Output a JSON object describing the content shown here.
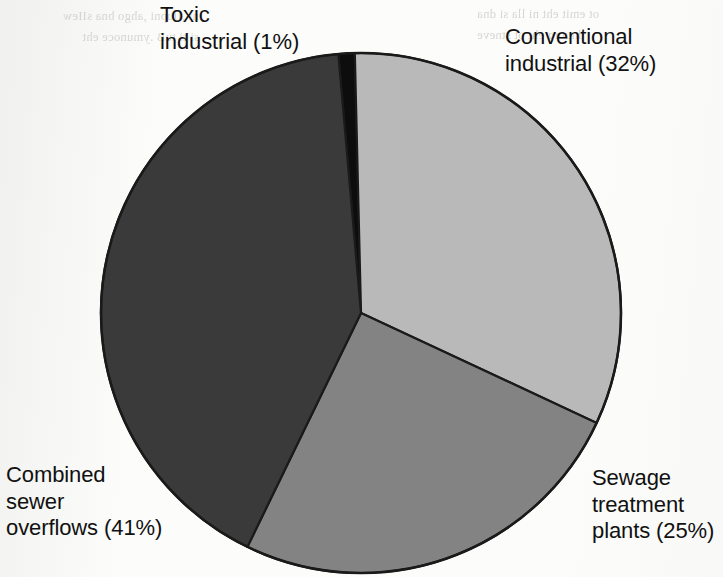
{
  "figure": {
    "background_color": "#fcfcfb",
    "outline_color": "#1a1a1a"
  },
  "chart_data": {
    "type": "pie",
    "title": "",
    "subtitle": "",
    "xlabel": "",
    "ylabel": "",
    "legend_position": "callout-labels",
    "grid": false,
    "units": "percent",
    "start_angle_deg": -5,
    "direction": "clockwise",
    "center": {
      "x": 361,
      "y": 313
    },
    "radius": 260,
    "categories": [
      "Toxic industrial",
      "Conventional industrial",
      "Sewage treatment plants",
      "Combined sewer overflows"
    ],
    "values": [
      1,
      32,
      25,
      41
    ],
    "colors": [
      "#0d0d0d",
      "#b9b9b9",
      "#838383",
      "#3a3a3a"
    ],
    "slices": [
      {
        "name": "toxic-industrial",
        "label_line_1": "Toxic",
        "label_line_2": "industrial (1%)",
        "label_text": "Toxic\nindustrial (1%)",
        "value": 1,
        "percent": "1%",
        "color": "#0d0d0d"
      },
      {
        "name": "conventional-industrial",
        "label_line_1": "Conventional",
        "label_line_2": "industrial (32%)",
        "label_text": "Conventional\nindustrial (32%)",
        "value": 32,
        "percent": "32%",
        "color": "#b9b9b9"
      },
      {
        "name": "sewage-treatment-plants",
        "label_line_1": "Sewage",
        "label_line_2": "treatment",
        "label_line_3": "plants (25%)",
        "label_text": "Sewage\ntreatment\nplants (25%)",
        "value": 25,
        "percent": "25%",
        "color": "#838383"
      },
      {
        "name": "combined-sewer-overflows",
        "label_line_1": "Combined",
        "label_line_2": "sewer",
        "label_line_3": "overflows (41%)",
        "label_text": "Combined\nsewer\noverflows (41%)",
        "value": 41,
        "percent": "41%",
        "color": "#3a3a3a"
      }
    ]
  },
  "scan_artifacts": {
    "left_ghost": "ni ,Ilupni ,ahgo bna sIIew\nsi ti tuB .ymunoce eht",
    "right_ghost": "ot emit eht ni lla si dna\ndnuorg eht ot stneve",
    "mid_ghost": "taht dna oslA"
  }
}
